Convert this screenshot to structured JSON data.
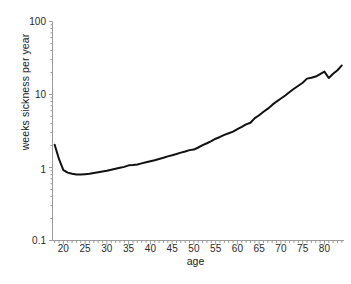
{
  "chart_data": {
    "type": "line",
    "title": "",
    "xlabel": "age",
    "ylabel": "weeks sickness per year",
    "yscale": "log",
    "xscale": "linear",
    "xlim": [
      17.5,
      84.5
    ],
    "ylim": [
      0.1,
      100
    ],
    "grid": false,
    "legend": null,
    "y_tick_labels": [
      "100",
      "10",
      "1",
      "0.1"
    ],
    "y_tick_values": [
      100,
      10,
      1,
      0.1
    ],
    "y_minor_ticks": true,
    "x_tick_labels": [
      "20",
      "25",
      "30",
      "35",
      "40",
      "45",
      "50",
      "55",
      "60",
      "65",
      "70",
      "75",
      "80"
    ],
    "x_tick_values": [
      20,
      25,
      30,
      35,
      40,
      45,
      50,
      55,
      60,
      65,
      70,
      75,
      80
    ],
    "x_minor_tick_step": 1,
    "line_color": "#111111",
    "line_width": 2.0,
    "axis_color": "#9a9a9a",
    "background": "#ffffff",
    "series": [
      {
        "name": "weeks sickness per year",
        "x": [
          18,
          19,
          20,
          21,
          22,
          23,
          24,
          25,
          26,
          27,
          28,
          29,
          30,
          31,
          32,
          33,
          34,
          35,
          36,
          37,
          38,
          39,
          40,
          41,
          42,
          43,
          44,
          45,
          46,
          47,
          48,
          49,
          50,
          51,
          52,
          53,
          54,
          55,
          56,
          57,
          58,
          59,
          60,
          61,
          62,
          63,
          64,
          65,
          66,
          67,
          68,
          69,
          70,
          71,
          72,
          73,
          74,
          75,
          76,
          77,
          78,
          79,
          80,
          81,
          82,
          83,
          84
        ],
        "y": [
          2.05,
          1.3,
          0.92,
          0.85,
          0.82,
          0.8,
          0.8,
          0.81,
          0.82,
          0.84,
          0.86,
          0.88,
          0.9,
          0.93,
          0.96,
          0.99,
          1.02,
          1.07,
          1.08,
          1.1,
          1.14,
          1.18,
          1.22,
          1.26,
          1.31,
          1.36,
          1.42,
          1.47,
          1.53,
          1.6,
          1.66,
          1.73,
          1.76,
          1.88,
          2.02,
          2.15,
          2.3,
          2.48,
          2.62,
          2.8,
          2.95,
          3.1,
          3.35,
          3.6,
          3.9,
          4.1,
          4.75,
          5.2,
          5.8,
          6.4,
          7.2,
          8.0,
          8.8,
          9.7,
          10.8,
          12.0,
          13.2,
          14.5,
          16.5,
          17.0,
          17.6,
          19.0,
          20.6,
          16.8,
          19.2,
          21.5,
          25.0
        ]
      }
    ]
  }
}
